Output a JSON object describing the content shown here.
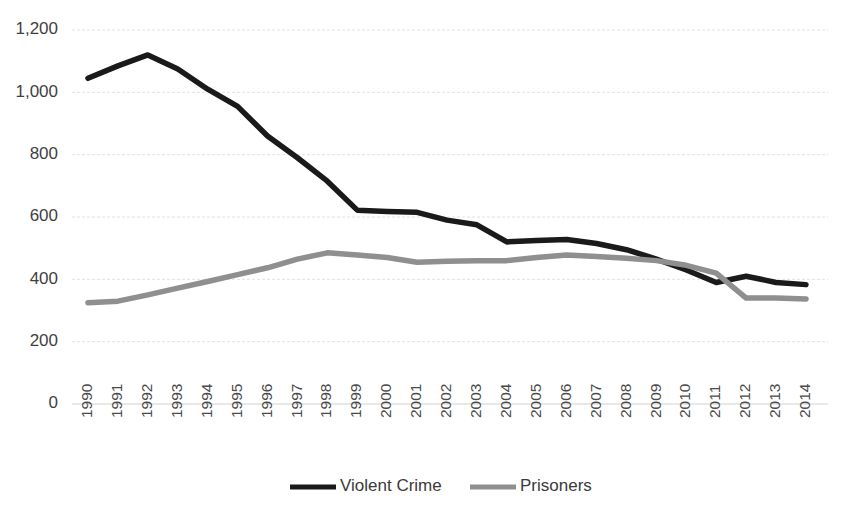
{
  "chart_data": {
    "type": "line",
    "title": "",
    "subtitle": "",
    "xlabel": "",
    "ylabel": "",
    "grid": true,
    "legend_position": "bottom",
    "xlim": [
      1990,
      2014
    ],
    "ylim": [
      0,
      1200
    ],
    "y_ticks": [
      0,
      200,
      400,
      600,
      800,
      1000,
      1200
    ],
    "y_tick_labels": [
      "0",
      "200",
      "400",
      "600",
      "800",
      "1,000",
      "1,200"
    ],
    "categories": [
      "1990",
      "1991",
      "1992",
      "1993",
      "1994",
      "1995",
      "1996",
      "1997",
      "1998",
      "1999",
      "2000",
      "2001",
      "2002",
      "2003",
      "2004",
      "2005",
      "2006",
      "2007",
      "2008",
      "2009",
      "2010",
      "2011",
      "2012",
      "2013",
      "2014"
    ],
    "series": [
      {
        "name": "Violent Crime",
        "color": "#1a1a1a",
        "stroke_width": 5.5,
        "values": [
          1045,
          1085,
          1120,
          1075,
          1010,
          955,
          860,
          790,
          715,
          622,
          618,
          615,
          590,
          575,
          520,
          525,
          528,
          515,
          495,
          465,
          430,
          390,
          410,
          390,
          383
        ]
      },
      {
        "name": "Prisoners",
        "color": "#8f8f8f",
        "stroke_width": 5.5,
        "values": [
          325,
          330,
          350,
          372,
          393,
          415,
          437,
          465,
          485,
          478,
          470,
          455,
          458,
          460,
          460,
          470,
          478,
          473,
          468,
          460,
          445,
          420,
          340,
          340,
          337
        ]
      }
    ]
  },
  "legend": {
    "items": [
      {
        "label": "Violent Crime",
        "color": "#1a1a1a"
      },
      {
        "label": "Prisoners",
        "color": "#8f8f8f"
      }
    ]
  }
}
